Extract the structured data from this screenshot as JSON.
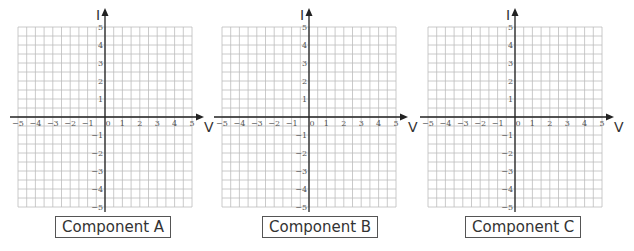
{
  "chart_data": [
    {
      "type": "scatter",
      "title": "Component A",
      "xlabel": "V",
      "ylabel": "I",
      "xlim": [
        -5,
        5
      ],
      "ylim": [
        -5,
        5
      ],
      "x_ticks": [
        -5,
        -4,
        -3,
        -2,
        -1,
        0,
        1,
        2,
        3,
        4,
        5
      ],
      "y_ticks": [
        -5,
        -4,
        -3,
        -2,
        -1,
        1,
        2,
        3,
        4,
        5
      ],
      "grid": true,
      "grid_subdivisions_per_unit": 2,
      "series": []
    },
    {
      "type": "scatter",
      "title": "Component B",
      "xlabel": "V",
      "ylabel": "I",
      "xlim": [
        -5,
        5
      ],
      "ylim": [
        -5,
        5
      ],
      "x_ticks": [
        -5,
        -4,
        -3,
        -2,
        -1,
        0,
        1,
        2,
        3,
        4,
        5
      ],
      "y_ticks": [
        -5,
        -4,
        -3,
        -2,
        -1,
        1,
        2,
        3,
        4,
        5
      ],
      "grid": true,
      "grid_subdivisions_per_unit": 2,
      "series": []
    },
    {
      "type": "scatter",
      "title": "Component C",
      "xlabel": "V",
      "ylabel": "I",
      "xlim": [
        -5,
        5
      ],
      "ylim": [
        -5,
        5
      ],
      "x_ticks": [
        -5,
        -4,
        -3,
        -2,
        -1,
        0,
        1,
        2,
        3,
        4,
        5
      ],
      "y_ticks": [
        -5,
        -4,
        -3,
        -2,
        -1,
        1,
        2,
        3,
        4,
        5
      ],
      "grid": true,
      "grid_subdivisions_per_unit": 2,
      "series": []
    }
  ],
  "panels": [
    {
      "label": "Component A",
      "x_axis_name": "V",
      "y_axis_name": "I"
    },
    {
      "label": "Component B",
      "x_axis_name": "V",
      "y_axis_name": "I"
    },
    {
      "label": "Component C",
      "x_axis_name": "V",
      "y_axis_name": "I"
    }
  ],
  "colors": {
    "grid": "#bdbdbd",
    "axis": "#222222",
    "text": "#333333"
  }
}
